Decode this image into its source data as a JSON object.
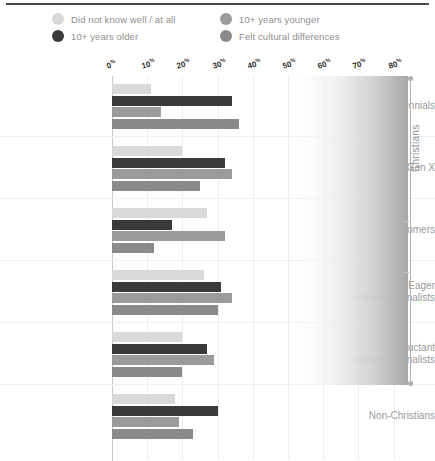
{
  "chart_data": {
    "type": "bar",
    "orientation": "horizontal",
    "title": "",
    "subtitle": "",
    "xlabel": "",
    "ylabel": "",
    "xlim": [
      0,
      80
    ],
    "grid": true,
    "legend_position": "top",
    "xticks": [
      "0",
      "10",
      "20",
      "30",
      "40",
      "50",
      "60",
      "70",
      "80"
    ],
    "xtick_suffix": "%",
    "categories": [
      "Millennials",
      "Gen X",
      "Boomers",
      "Eager conversationalists",
      "Reluctant conversationalists",
      "Non-Christians"
    ],
    "series": [
      {
        "name": "Did not know well / at all",
        "color": "#d9d9d9",
        "values": [
          11,
          20,
          27,
          26,
          20,
          18
        ]
      },
      {
        "name": "10+ years older",
        "color": "#3a3a3a",
        "values": [
          34,
          32,
          17,
          31,
          27,
          30
        ]
      },
      {
        "name": "10+ years younger",
        "color": "#9b9b9b",
        "values": [
          14,
          34,
          32,
          34,
          29,
          19
        ]
      },
      {
        "name": "Felt cultural differences",
        "color": "#8a8a8a",
        "values": [
          36,
          25,
          12,
          30,
          20,
          23
        ]
      }
    ],
    "annotations": [
      {
        "text": "Christians",
        "type": "bracket-label",
        "covers": [
          "Millennials",
          "Gen X",
          "Boomers",
          "Eager conversationalists",
          "Reluctant conversationalists"
        ]
      }
    ]
  },
  "legend": {
    "items": [
      {
        "label": "Did not know well / at all",
        "color": "#d9d9d9"
      },
      {
        "label": "10+ years older",
        "color": "#3a3a3a"
      },
      {
        "label": "10+ years younger",
        "color": "#9b9b9b"
      },
      {
        "label": "Felt cultural differences",
        "color": "#8a8a8a"
      }
    ]
  },
  "bracket": {
    "label": "Christians"
  }
}
